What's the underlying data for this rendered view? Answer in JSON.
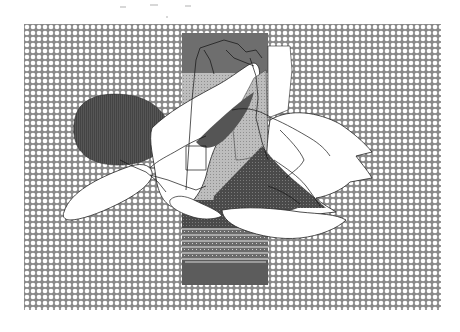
{
  "image": {
    "kind": "abstract halftone collage",
    "background": "#ffffff",
    "frame": {
      "x": 24,
      "y": 24,
      "width": 417,
      "height": 286
    },
    "pattern": {
      "name": "circle-dot-halftone",
      "cell": 6,
      "ink": "#8a8a8a",
      "paper": "#ffffff"
    },
    "strip": {
      "x": 182,
      "y": 33,
      "width": 86,
      "height": 252,
      "top_color": "#6e6e6e",
      "mid_color": "#b8b8b8",
      "dark_color": "#4a4a4a",
      "bottom_color": "#5c5c5c"
    },
    "shapes": [
      {
        "name": "dark-blob",
        "color": "#4f4f4f"
      },
      {
        "name": "white-petal-left",
        "color": "#ffffff"
      },
      {
        "name": "white-wing-right",
        "color": "#ffffff"
      },
      {
        "name": "dark-triangle",
        "color": "#3e3e3e"
      },
      {
        "name": "light-gray-wedge",
        "color": "#bdbdbd"
      }
    ],
    "caption": "Abstract grayscale halftone composition"
  }
}
